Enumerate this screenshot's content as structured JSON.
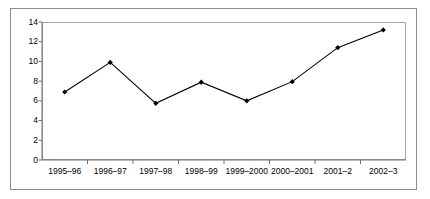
{
  "chart_data": {
    "type": "line",
    "title": "",
    "subtitle": "",
    "xlabel": "",
    "ylabel": "",
    "categories": [
      "1995–96",
      "1996–97",
      "1997–98",
      "1998–99",
      "1999–2000",
      "2000–2001",
      "2001–2",
      "2002–3"
    ],
    "values": [
      6.9,
      9.9,
      5.75,
      7.9,
      6.0,
      7.95,
      11.4,
      13.2
    ],
    "series": [
      {
        "name": "",
        "values": [
          6.9,
          9.9,
          5.75,
          7.9,
          6.0,
          7.95,
          11.4,
          13.2
        ]
      }
    ],
    "ylim": [
      0,
      14
    ],
    "xlim": [
      0,
      8
    ],
    "ytick_labels": [
      "0",
      "2",
      "4",
      "6",
      "8",
      "10",
      "12",
      "14"
    ],
    "ytick_values": [
      0,
      2,
      4,
      6,
      8,
      10,
      12,
      14
    ],
    "grid": false,
    "legend": false,
    "legend_position": "none",
    "marker": "diamond",
    "line_color": "#000000",
    "marker_color": "#000000",
    "plot_background": "#ffffff",
    "frame_color": "#a6a6a6",
    "outer_border_color": "#8b8b8b",
    "annotations": []
  }
}
